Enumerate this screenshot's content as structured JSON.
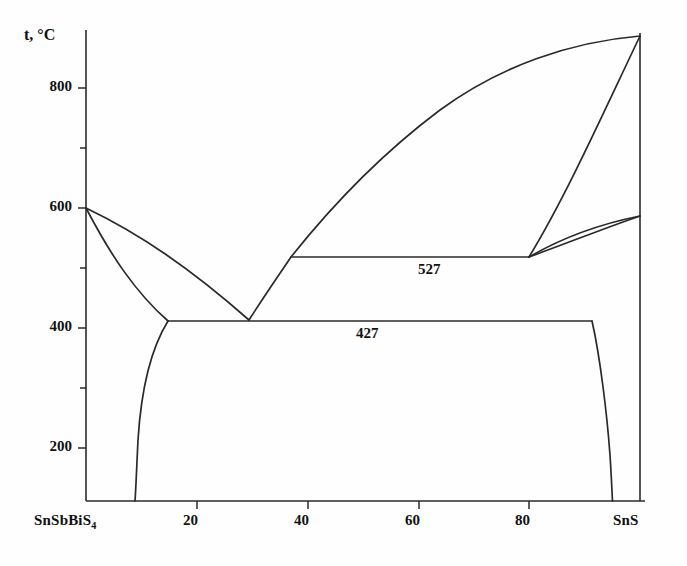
{
  "figure": {
    "kind": "phase-diagram",
    "background": "#fefefe",
    "line_color": "#2a2a2a"
  },
  "axes": {
    "y_title": "t, °C",
    "y_ticks_major": [
      "800",
      "600",
      "400",
      "200"
    ],
    "y_ticks_minor": [
      "700",
      "500",
      "300"
    ],
    "x_ticks": [
      "20",
      "40",
      "60",
      "80"
    ],
    "x_left_endpoint_html": "SnSbBiS<sub>4</sub>",
    "x_left_endpoint": "SnSbBiS4",
    "x_right_endpoint": "SnS"
  },
  "annotations": {
    "upper_isotherm": "527",
    "lower_isotherm": "427"
  },
  "chart_data": {
    "type": "line",
    "title": "",
    "xlabel": "",
    "ylabel": "t, °C",
    "xlim": [
      0,
      100
    ],
    "ylim": [
      112,
      608
    ],
    "grid": false,
    "legend": "none",
    "x_tick_values": [
      20,
      40,
      60,
      80
    ],
    "y_tick_values": [
      200,
      400,
      600,
      800
    ],
    "y_minor_tick_values": [
      300,
      500,
      700
    ],
    "x_endpoints": {
      "left": "SnSbBiS4",
      "right": "SnS"
    },
    "invariant_reactions": [
      {
        "label": "527",
        "temperature": 527,
        "x_from": 37,
        "x_to": 80
      },
      {
        "label": "427",
        "temperature": 427,
        "x_from": 14.8,
        "x_to": 91.5
      }
    ],
    "eutectic_points": [
      {
        "x": 29.5,
        "t": 427
      },
      {
        "x": 80.0,
        "t": 527
      }
    ],
    "series": [
      {
        "name": "left-liquidus",
        "points": [
          [
            0,
            600
          ],
          [
            8,
            560
          ],
          [
            16,
            516
          ],
          [
            24,
            466
          ],
          [
            29.5,
            427
          ]
        ]
      },
      {
        "name": "left-solidus-solvus",
        "points": [
          [
            0,
            600
          ],
          [
            5,
            545
          ],
          [
            9,
            500
          ],
          [
            12,
            462
          ],
          [
            14.8,
            427
          ]
        ]
      },
      {
        "name": "left-solvus-lower",
        "points": [
          [
            14.8,
            427
          ],
          [
            12.5,
            390
          ],
          [
            10.8,
            340
          ],
          [
            10.0,
            270
          ],
          [
            9.6,
            180
          ],
          [
            9.5,
            112
          ]
        ]
      },
      {
        "name": "central-liquidus",
        "points": [
          [
            29.5,
            427
          ],
          [
            34,
            487
          ],
          [
            37,
            527
          ],
          [
            44,
            625
          ],
          [
            52,
            710
          ],
          [
            62,
            787
          ],
          [
            74,
            848
          ],
          [
            86,
            881
          ],
          [
            100,
            895
          ]
        ]
      },
      {
        "name": "snS-liquidus-descending",
        "points": [
          [
            100,
            895
          ],
          [
            95,
            800
          ],
          [
            90,
            705
          ],
          [
            85,
            612
          ],
          [
            80,
            527
          ]
        ]
      },
      {
        "name": "snS-solidus",
        "points": [
          [
            80,
            527
          ],
          [
            86,
            552
          ],
          [
            92,
            575
          ],
          [
            100,
            593
          ]
        ]
      },
      {
        "name": "snS-solvus-upper",
        "points": [
          [
            100,
            593
          ],
          [
            94,
            560
          ],
          [
            88,
            540
          ],
          [
            83,
            530
          ],
          [
            80,
            527
          ]
        ]
      },
      {
        "name": "right-solvus-lower",
        "points": [
          [
            91.5,
            427
          ],
          [
            93,
            390
          ],
          [
            94.3,
            330
          ],
          [
            95.0,
            250
          ],
          [
            95.3,
            170
          ],
          [
            95.4,
            112
          ]
        ]
      }
    ]
  }
}
